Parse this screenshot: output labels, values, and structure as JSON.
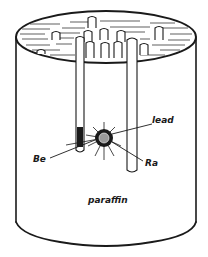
{
  "figure": {
    "labels": {
      "lead": "lead",
      "be": "Be",
      "ra": "Ra",
      "paraffin": "paraffin"
    },
    "colors": {
      "ink": "#1a1a1a",
      "background": "#ffffff",
      "source_core": "#9a9a9a"
    }
  }
}
